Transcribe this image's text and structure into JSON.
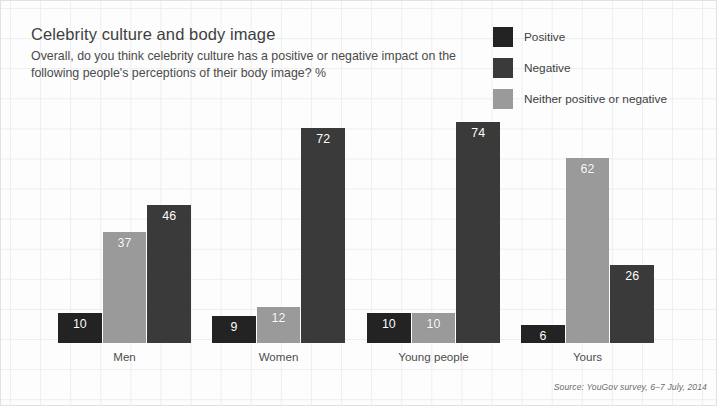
{
  "header": {
    "title": "Celebrity culture and body image",
    "subtitle": "Overall, do you think celebrity culture has a positive or negative impact on the following people's perceptions of their body image? %"
  },
  "legend": {
    "position": "top-right",
    "items": [
      {
        "label": "Positive",
        "color": "#232323"
      },
      {
        "label": "Negative",
        "color": "#3a3a3a"
      },
      {
        "label": "Neither positive or negative",
        "color": "#9a9a9a"
      }
    ]
  },
  "source": {
    "text": "Source: YouGov survey, 6–7 July, 2014"
  },
  "chart_data": {
    "type": "bar",
    "title": "Celebrity culture and body image",
    "subtitle": "Overall, do you think celebrity culture has a positive or negative impact on the following people's perceptions of their body image? %",
    "xlabel": "",
    "ylabel": "",
    "ylim": [
      0,
      80
    ],
    "grid": true,
    "legend_position": "top-right",
    "unit": "%",
    "categories": [
      "Men",
      "Women",
      "Young people",
      "Yours"
    ],
    "series": [
      {
        "name": "Positive",
        "color": "#232323",
        "values": [
          10,
          9,
          10,
          6
        ]
      },
      {
        "name": "Neither positive or negative",
        "color": "#9a9a9a",
        "values": [
          37,
          12,
          10,
          62
        ]
      },
      {
        "name": "Negative",
        "color": "#3a3a3a",
        "values": [
          46,
          72,
          74,
          26
        ]
      }
    ],
    "bar_draw_order": [
      "Positive",
      "Neither positive or negative",
      "Negative"
    ],
    "groups": [
      {
        "category": "Men",
        "bars": [
          {
            "series": "Positive",
            "value": 10
          },
          {
            "series": "Neither positive or negative",
            "value": 37
          },
          {
            "series": "Negative",
            "value": 46
          }
        ]
      },
      {
        "category": "Women",
        "bars": [
          {
            "series": "Positive",
            "value": 9
          },
          {
            "series": "Neither positive or negative",
            "value": 12
          },
          {
            "series": "Negative",
            "value": 72
          }
        ]
      },
      {
        "category": "Young people",
        "bars": [
          {
            "series": "Positive",
            "value": 10
          },
          {
            "series": "Neither positive or negative",
            "value": 10
          },
          {
            "series": "Negative",
            "value": 74
          }
        ]
      },
      {
        "category": "Yours",
        "bars": [
          {
            "series": "Positive",
            "value": 6
          },
          {
            "series": "Neither positive or negative",
            "value": 62
          },
          {
            "series": "Negative",
            "value": 26
          }
        ]
      }
    ]
  },
  "layout": {
    "px_per_unit": 2.99,
    "group_left": [
      58,
      212,
      367,
      521
    ],
    "group_width": 133
  }
}
